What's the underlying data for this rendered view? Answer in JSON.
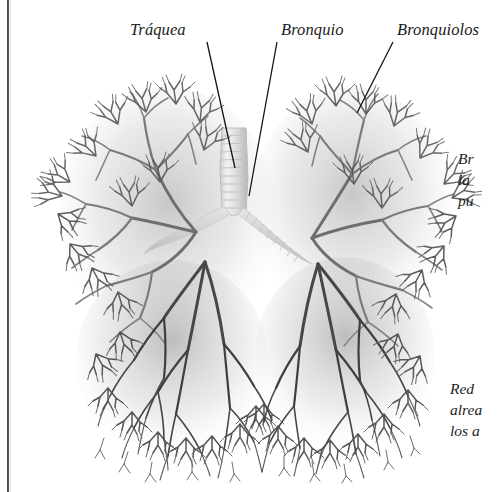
{
  "figure": {
    "kind": "anatomical-photograph",
    "background_color": "#ffffff",
    "ink_color": "#1a1a1a",
    "cast_dark": "#4a4a4a",
    "cast_mid": "#8f8f8f",
    "cast_light": "#d8d8d8",
    "airway_light": "#e9e9e9"
  },
  "labels": [
    {
      "id": "traquea",
      "text": "Tráquea",
      "x": 130,
      "y": 20
    },
    {
      "id": "bronquio",
      "text": "Bronquio",
      "x": 281,
      "y": 20
    },
    {
      "id": "bronquiolos",
      "text": "Bronquiolos",
      "x": 397,
      "y": 20
    }
  ],
  "leader_lines": [
    {
      "id": "leader-traquea",
      "x1": 207,
      "y1": 42,
      "x2": 235,
      "y2": 168
    },
    {
      "id": "leader-bronquio",
      "x1": 277,
      "y1": 42,
      "x2": 249,
      "y2": 196
    },
    {
      "id": "leader-bronquiolos",
      "x1": 393,
      "y1": 42,
      "x2": 357,
      "y2": 113
    }
  ],
  "captions": [
    {
      "id": "caption-bronquios",
      "x": 458,
      "y": 148,
      "lines": [
        "Br",
        "la",
        "pu"
      ],
      "note": "clipped-at-right-page-edge"
    },
    {
      "id": "caption-red-capilar",
      "x": 450,
      "y": 378,
      "lines": [
        "Red ",
        "alrea",
        "los a"
      ],
      "note": "clipped-at-right-page-edge"
    }
  ],
  "gutter": {
    "id": "page-gutter-rule",
    "x": 7,
    "width": 2
  }
}
